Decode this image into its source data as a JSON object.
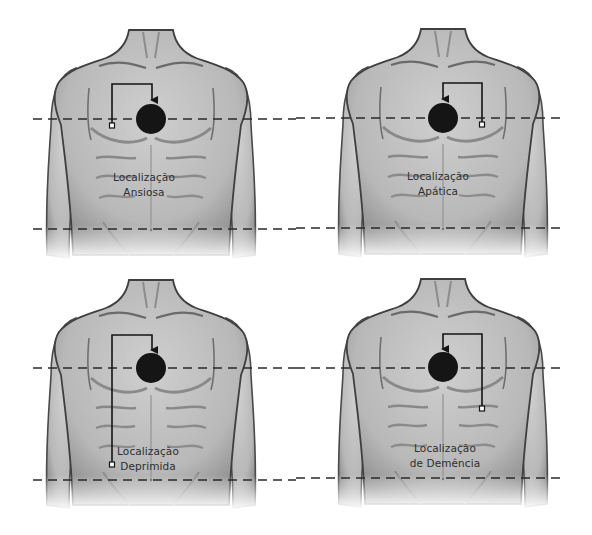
{
  "diagram": {
    "colors": {
      "background": "#ffffff",
      "torso_fill": "#bdbdbd",
      "torso_shadow": "#8a8a8a",
      "outline": "#3a3a3a",
      "marker": "#151515",
      "dashed_line": "#2a2a2a",
      "text": "#2e2e2e"
    },
    "panels": [
      {
        "id": "ansiosa",
        "label_line1": "Localização",
        "label_line2": "Ansiosa",
        "position": "top-left",
        "source_side": "left",
        "source_point": "upper-chest"
      },
      {
        "id": "apatica",
        "label_line1": "Localização",
        "label_line2": "Apática",
        "position": "top-right",
        "source_side": "right",
        "source_point": "upper-chest"
      },
      {
        "id": "deprimida",
        "label_line1": "Localização",
        "label_line2": "Deprimida",
        "position": "bottom-left",
        "source_side": "left",
        "source_point": "lower-abdomen"
      },
      {
        "id": "demencia",
        "label_line1": "Localização",
        "label_line2": "de Demência",
        "position": "bottom-right",
        "source_side": "right",
        "source_point": "mid-abdomen"
      }
    ]
  }
}
